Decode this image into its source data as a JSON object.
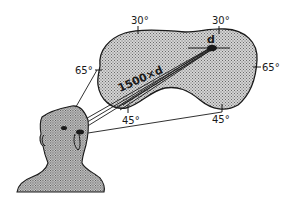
{
  "diagram": {
    "colors": {
      "stroke": "#1a1a1a",
      "field_fill": "#bdbdbd",
      "head_fill": "#c4c4c4",
      "background": "#ffffff"
    },
    "angle_labels": {
      "top_left": "30°",
      "top_right": "30°",
      "left": "65°",
      "right": "65°",
      "bottom_left": "45°",
      "bottom_right": "45°"
    },
    "distance_label": "1500×d",
    "target_label": "d"
  }
}
